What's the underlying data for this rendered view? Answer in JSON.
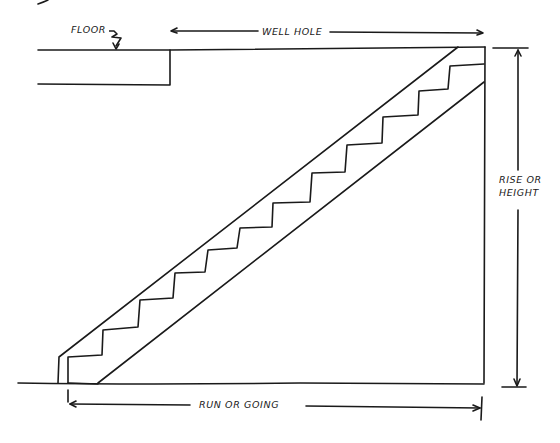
{
  "diagram": {
    "labels": {
      "floor": "FLOOR",
      "well_hole": "WELL HOLE",
      "rise_line1": "RISE OR",
      "rise_line2": "HEIGHT",
      "run": "RUN OR GOING"
    },
    "stair": {
      "step_count": 12,
      "treads_visible": 12
    },
    "stroke_color": "#1a1a1a",
    "background": "#ffffff"
  }
}
